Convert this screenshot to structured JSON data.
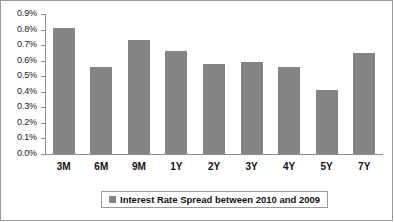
{
  "chart_data": {
    "type": "bar",
    "title": "",
    "subtitle": "",
    "xlabel": "",
    "ylabel": "",
    "categories": [
      "3M",
      "6M",
      "9M",
      "1Y",
      "2Y",
      "3Y",
      "4Y",
      "5Y",
      "7Y"
    ],
    "values": [
      0.81,
      0.56,
      0.73,
      0.66,
      0.58,
      0.59,
      0.56,
      0.41,
      0.65
    ],
    "value_unit": "%",
    "ylim": [
      0.0,
      0.9
    ],
    "ytick_labels": [
      "0.9%",
      "0.8%",
      "0.7%",
      "0.6%",
      "0.5%",
      "0.4%",
      "0.3%",
      "0.2%",
      "0.1%",
      "0.0%"
    ],
    "ytick_values": [
      0.9,
      0.8,
      0.7,
      0.6,
      0.5,
      0.4,
      0.3,
      0.2,
      0.1,
      0.0
    ],
    "ytick_step": 0.1,
    "grid": false,
    "legend_position": "bottom",
    "series": [
      {
        "name": "Interest Rate Spread between 2010 and 2009",
        "color": "#848484",
        "values": [
          0.81,
          0.56,
          0.73,
          0.66,
          0.58,
          0.59,
          0.56,
          0.41,
          0.65
        ]
      }
    ]
  },
  "legend": {
    "entry_label": "Interest Rate Spread between 2010 and 2009",
    "swatch_color": "#848484"
  },
  "axis": {
    "line_color": "#8c8c8c"
  },
  "frame": {
    "border_color": "#9a9a9a",
    "background": "#ffffff"
  }
}
